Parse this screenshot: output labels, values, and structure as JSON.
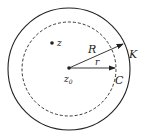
{
  "diagram": {
    "outer_circle": {
      "label": "K",
      "radius_label": "R"
    },
    "inner_circle": {
      "label": "C",
      "radius_label": "r",
      "style": "dashed"
    },
    "center": {
      "label": "z",
      "subscript": "0"
    },
    "point": {
      "label": "z"
    }
  },
  "colors": {
    "stroke": "#222222",
    "background": "#ffffff"
  }
}
